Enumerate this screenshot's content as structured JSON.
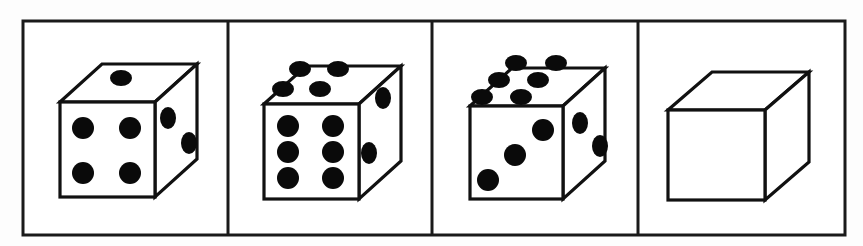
{
  "figure": {
    "title": "Four dice panels",
    "description": "A horizontal strip divided into four rectangular panels, each containing one isometric cube drawn in black line art on white.",
    "background_color": "#fdfdfd",
    "line_color": "#1a1a1a",
    "pip_color": "#0a0a0a",
    "face_color": "#ffffff",
    "panel_count": 4
  },
  "frame": {
    "name": "outer-rectangle",
    "x": 23,
    "y": 21,
    "width": 822,
    "height": 214,
    "stroke_width": 3
  },
  "dividers": [
    {
      "label": "divider-1",
      "x": 228
    },
    {
      "label": "divider-2",
      "x": 432
    },
    {
      "label": "divider-3",
      "x": 638
    }
  ],
  "panels": [
    {
      "index": 1,
      "label": "Panel 1",
      "cube_label": "Die showing four",
      "blank": false,
      "front_value": 4,
      "top_value": 1,
      "right_value": 2,
      "front_pattern": "four-corners",
      "top_pattern": "single-center",
      "right_pattern": "two-diagonal",
      "cube": {
        "front": {
          "x": 60,
          "y": 102,
          "w": 95,
          "h": 95
        },
        "depth_x": 42,
        "depth_y": -38
      },
      "front_pips": [
        {
          "cx": 83,
          "cy": 128,
          "r": 11
        },
        {
          "cx": 130,
          "cy": 128,
          "r": 11
        },
        {
          "cx": 83,
          "cy": 173,
          "r": 11
        },
        {
          "cx": 130,
          "cy": 173,
          "r": 11
        }
      ],
      "top_pips": [
        {
          "cx": 121,
          "cy": 78,
          "rx": 11,
          "ry": 8
        }
      ],
      "right_pips": [
        {
          "cx": 168,
          "cy": 118,
          "rx": 8,
          "ry": 11
        },
        {
          "cx": 189,
          "cy": 143,
          "rx": 8,
          "ry": 11
        }
      ]
    },
    {
      "index": 2,
      "label": "Panel 2",
      "cube_label": "Die showing six",
      "blank": false,
      "front_value": 6,
      "top_value": 4,
      "right_value": 2,
      "front_pattern": "two-columns-of-three",
      "top_pattern": "four-corners",
      "right_pattern": "two-diagonal",
      "cube": {
        "front": {
          "x": 264,
          "y": 104,
          "w": 95,
          "h": 95
        },
        "depth_x": 42,
        "depth_y": -38
      },
      "front_pips": [
        {
          "cx": 288,
          "cy": 126,
          "r": 11
        },
        {
          "cx": 333,
          "cy": 126,
          "r": 11
        },
        {
          "cx": 288,
          "cy": 152,
          "r": 11
        },
        {
          "cx": 333,
          "cy": 152,
          "r": 11
        },
        {
          "cx": 288,
          "cy": 178,
          "r": 11
        },
        {
          "cx": 333,
          "cy": 178,
          "r": 11
        }
      ],
      "top_pips": [
        {
          "cx": 300,
          "cy": 69,
          "rx": 11,
          "ry": 8
        },
        {
          "cx": 338,
          "cy": 69,
          "rx": 11,
          "ry": 8
        },
        {
          "cx": 283,
          "cy": 89,
          "rx": 11,
          "ry": 8
        },
        {
          "cx": 320,
          "cy": 89,
          "rx": 11,
          "ry": 8
        }
      ],
      "right_pips": [
        {
          "cx": 383,
          "cy": 98,
          "rx": 8,
          "ry": 11
        },
        {
          "cx": 369,
          "cy": 153,
          "rx": 8,
          "ry": 11
        }
      ]
    },
    {
      "index": 3,
      "label": "Panel 3",
      "cube_label": "Die showing three",
      "blank": false,
      "front_value": 3,
      "top_value": 6,
      "right_value": 2,
      "front_pattern": "three-diagonal",
      "top_pattern": "two-rows-of-three",
      "right_pattern": "two-diagonal",
      "cube": {
        "front": {
          "x": 470,
          "y": 106,
          "w": 93,
          "h": 93
        },
        "depth_x": 42,
        "depth_y": -38
      },
      "front_pips": [
        {
          "cx": 488,
          "cy": 180,
          "r": 11
        },
        {
          "cx": 515,
          "cy": 155,
          "r": 11
        },
        {
          "cx": 543,
          "cy": 130,
          "r": 11
        },
        {
          "cx": 0,
          "cy": 0,
          "r": 0
        }
      ],
      "top_pips": [
        {
          "cx": 516,
          "cy": 63,
          "rx": 11,
          "ry": 8
        },
        {
          "cx": 556,
          "cy": 63,
          "rx": 11,
          "ry": 8
        },
        {
          "cx": 538,
          "cy": 80,
          "rx": 11,
          "ry": 8
        },
        {
          "cx": 499,
          "cy": 80,
          "rx": 11,
          "ry": 8
        },
        {
          "cx": 521,
          "cy": 97,
          "rx": 11,
          "ry": 8
        },
        {
          "cx": 482,
          "cy": 97,
          "rx": 11,
          "ry": 8
        }
      ],
      "right_pips": [
        {
          "cx": 580,
          "cy": 123,
          "rx": 8,
          "ry": 11
        },
        {
          "cx": 600,
          "cy": 146,
          "rx": 8,
          "ry": 11
        }
      ]
    },
    {
      "index": 4,
      "label": "Panel 4",
      "cube_label": "Blank cube",
      "blank": true,
      "front_value": 0,
      "top_value": 0,
      "right_value": 0,
      "front_pattern": "blank",
      "top_pattern": "blank",
      "right_pattern": "blank",
      "cube": {
        "front": {
          "x": 668,
          "y": 110,
          "w": 97,
          "h": 90
        },
        "depth_x": 44,
        "depth_y": -38
      },
      "front_pips": [],
      "top_pips": [],
      "right_pips": []
    }
  ]
}
